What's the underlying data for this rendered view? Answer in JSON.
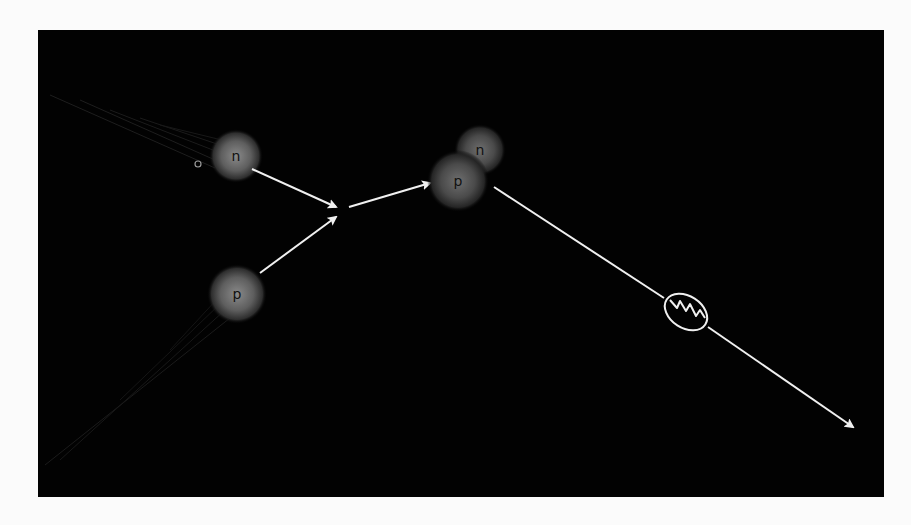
{
  "diagram": {
    "background_color": "#020202",
    "frame_color": "#fbfbfb",
    "arrow_color": "#f0f0f0",
    "particle_glow_color": "#6a6a6a",
    "particles": {
      "incoming_neutron": {
        "label": "n",
        "cx": 236,
        "cy": 156,
        "r": 26
      },
      "incoming_proton": {
        "label": "p",
        "cx": 237,
        "cy": 294,
        "r": 28
      },
      "bound_neutron": {
        "label": "n",
        "cx": 480,
        "cy": 150,
        "r": 25
      },
      "bound_proton": {
        "label": "p",
        "cx": 458,
        "cy": 180,
        "r": 29
      }
    },
    "photon_symbol": "gamma-wavy-ellipse",
    "small_marker": "circle-o"
  }
}
